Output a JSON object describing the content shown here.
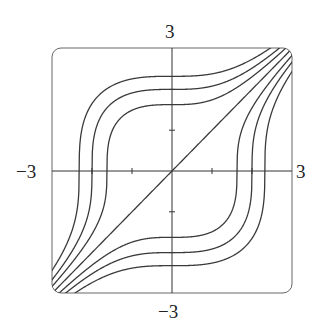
{
  "chart_data": {
    "type": "line",
    "title": "",
    "xlabel": "",
    "ylabel": "",
    "xlim": [
      -3,
      3
    ],
    "ylim": [
      -3,
      3
    ],
    "grid": false,
    "axis_labels": {
      "x_min": "−3",
      "x_max": "3",
      "y_min": "−3",
      "y_max": "3"
    },
    "ticks": {
      "x": [
        -2,
        -1,
        1,
        2
      ],
      "y": [
        -2,
        -1,
        1,
        2
      ]
    },
    "series": [
      {
        "name": "C=12.5",
        "C": 12.5
      },
      {
        "name": "C=8",
        "C": 8
      },
      {
        "name": "C=4.3",
        "C": 4.3
      },
      {
        "name": "C=0 (y=x)",
        "C": 0
      },
      {
        "name": "C=-4.3",
        "C": -4.3
      },
      {
        "name": "C=-8",
        "C": -8
      },
      {
        "name": "C=-12.5",
        "C": -12.5
      }
    ],
    "y_axis_crossings": [
      2.32,
      2.0,
      1.63,
      0,
      -1.63,
      -2.0,
      -2.32
    ],
    "colors": {
      "curve": "#3a3a3a",
      "axis": "#333333",
      "frame": "#555555"
    }
  }
}
